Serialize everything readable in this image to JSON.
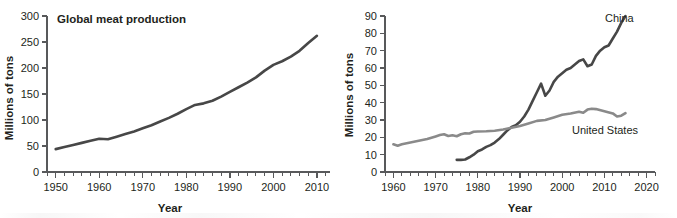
{
  "figure": {
    "background": "#ffffff",
    "line_color_dark": "#474747",
    "line_color_gray": "#8a8a8a",
    "axis_color": "#58595b",
    "text_color": "#231f20"
  },
  "chart_data": [
    {
      "type": "line",
      "panel": "left",
      "title": "Global meat production",
      "xlabel": "Year",
      "ylabel": "Millions of tons",
      "xlim": [
        1948,
        2013
      ],
      "ylim": [
        0,
        300
      ],
      "xticks": [
        1950,
        1960,
        1970,
        1980,
        1990,
        2000,
        2010
      ],
      "yticks": [
        0,
        50,
        100,
        150,
        200,
        250,
        300
      ],
      "xtick_labels": [
        "1950",
        "1960",
        "1970",
        "1980",
        "1990",
        "2000",
        "2010"
      ],
      "ytick_labels": [
        "0",
        "50",
        "100",
        "150",
        "200",
        "250",
        "300"
      ],
      "minor_tick_step": 2,
      "grid": false,
      "legend": "none",
      "series": [
        {
          "name": "Global meat production",
          "color": "#474747",
          "x": [
            1950,
            1952,
            1954,
            1956,
            1958,
            1960,
            1962,
            1964,
            1966,
            1968,
            1970,
            1972,
            1974,
            1976,
            1978,
            1980,
            1982,
            1984,
            1986,
            1988,
            1990,
            1992,
            1994,
            1996,
            1998,
            2000,
            2002,
            2004,
            2006,
            2008,
            2010
          ],
          "y": [
            44,
            48,
            52,
            56,
            60,
            64,
            63,
            68,
            73,
            78,
            84,
            90,
            97,
            104,
            112,
            121,
            129,
            132,
            137,
            145,
            154,
            163,
            172,
            182,
            195,
            206,
            213,
            222,
            233,
            248,
            262,
            280
          ]
        }
      ]
    },
    {
      "type": "line",
      "panel": "right",
      "title": "",
      "xlabel": "Year",
      "ylabel": "Millions of tons",
      "xlim": [
        1958,
        2022
      ],
      "ylim": [
        0,
        90
      ],
      "xticks": [
        1960,
        1970,
        1980,
        1990,
        2000,
        2010,
        2020
      ],
      "yticks": [
        0,
        10,
        20,
        30,
        40,
        50,
        60,
        70,
        80,
        90
      ],
      "xtick_labels": [
        "1960",
        "1970",
        "1980",
        "1990",
        "2000",
        "2010",
        "2020"
      ],
      "ytick_labels": [
        "0",
        "10",
        "20",
        "30",
        "40",
        "50",
        "60",
        "70",
        "80",
        "90"
      ],
      "minor_tick_step": 2,
      "grid": false,
      "legend": "inline-labels",
      "series": [
        {
          "name": "China",
          "label": "China",
          "color": "#474747",
          "x": [
            1975,
            1976,
            1977,
            1978,
            1979,
            1980,
            1981,
            1982,
            1983,
            1984,
            1985,
            1986,
            1987,
            1988,
            1989,
            1990,
            1991,
            1992,
            1993,
            1994,
            1995,
            1996,
            1997,
            1998,
            1999,
            2000,
            2001,
            2002,
            2003,
            2004,
            2005,
            2006,
            2007,
            2008,
            2009,
            2010,
            2011,
            2012,
            2013,
            2014,
            2015
          ],
          "y": [
            7,
            7,
            7.2,
            8.5,
            10,
            12,
            13,
            14.5,
            15.5,
            17,
            19,
            21.5,
            24,
            26,
            27,
            29,
            32,
            36,
            41,
            46,
            51,
            44,
            47,
            52,
            55,
            57,
            59,
            60,
            62,
            64,
            65,
            61,
            62,
            67,
            70,
            72,
            73,
            77,
            81,
            86,
            90
          ]
        },
        {
          "name": "United States",
          "label": "United States",
          "color": "#8a8a8a",
          "x": [
            1960,
            1961,
            1962,
            1964,
            1966,
            1968,
            1970,
            1971,
            1972,
            1973,
            1974,
            1975,
            1976,
            1977,
            1978,
            1979,
            1980,
            1982,
            1984,
            1986,
            1988,
            1990,
            1992,
            1994,
            1996,
            1998,
            2000,
            2002,
            2004,
            2005,
            2006,
            2007,
            2008,
            2010,
            2012,
            2013,
            2014,
            2015
          ],
          "y": [
            16,
            15.2,
            16,
            17,
            18,
            19,
            20.5,
            21.3,
            21.8,
            20.8,
            21.2,
            20.6,
            21.8,
            22.3,
            22.2,
            23.2,
            23.4,
            23.5,
            23.8,
            24.5,
            25.5,
            26.5,
            28,
            29.5,
            30,
            31.5,
            33,
            33.8,
            34.8,
            34.2,
            36,
            36.5,
            36.3,
            35,
            33.8,
            32,
            32.5,
            34
          ]
        }
      ]
    }
  ]
}
